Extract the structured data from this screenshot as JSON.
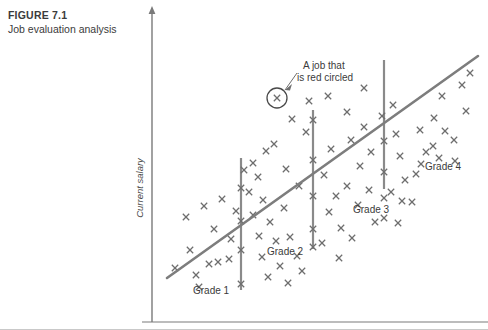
{
  "caption": {
    "figure_number": "FIGURE 7.1",
    "figure_title": "Job evaluation analysis"
  },
  "axes": {
    "y_label": "Current salary",
    "x_label": ""
  },
  "annotations": {
    "callout": "A job that\nis red circled",
    "callout_line1": "A job that",
    "callout_line2": "is red circled"
  },
  "grade_labels": [
    {
      "text": "Grade 1",
      "x": 193,
      "y": 294
    },
    {
      "text": "Grade 2",
      "x": 267,
      "y": 255
    },
    {
      "text": "Grade 3",
      "x": 353,
      "y": 213
    },
    {
      "text": "Grade 4",
      "x": 425,
      "y": 170
    }
  ],
  "colors": {
    "axis": "#7a7a7a",
    "marker": "#6e6e6e",
    "trend_line": "#7d7d7d",
    "grade_divider": "#8a8a8a",
    "text": "#3b3b3b",
    "background": "#ffffff",
    "border": "#c9c9c9"
  },
  "chart_data": {
    "type": "scatter",
    "title": "Job evaluation analysis",
    "xlabel": "",
    "ylabel": "Current salary",
    "grid": false,
    "legend": "none",
    "axis_origin": {
      "x": 152,
      "y": 322
    },
    "axis_top": {
      "x": 152,
      "y": 6
    },
    "axis_right": {
      "x": 488,
      "y": 322
    },
    "trend_line": {
      "x1": 167,
      "y1": 278,
      "x2": 478,
      "y2": 56
    },
    "grade_dividers": [
      {
        "grade": 1,
        "x": 241,
        "y1": 158,
        "y2": 290
      },
      {
        "grade": 2,
        "x": 313,
        "y1": 110,
        "y2": 249
      },
      {
        "grade": 3,
        "x": 384,
        "y1": 60,
        "y2": 189
      }
    ],
    "highlighted_point": {
      "x": 277,
      "y": 98,
      "radius": 10,
      "note": "A job that is red circled"
    },
    "points": [
      [
        186,
        217
      ],
      [
        204,
        206
      ],
      [
        214,
        229
      ],
      [
        222,
        199
      ],
      [
        190,
        250
      ],
      [
        209,
        264
      ],
      [
        229,
        259
      ],
      [
        231,
        239
      ],
      [
        175,
        268
      ],
      [
        196,
        275
      ],
      [
        218,
        262
      ],
      [
        236,
        211
      ],
      [
        241,
        221
      ],
      [
        241,
        250
      ],
      [
        241,
        284
      ],
      [
        241,
        188
      ],
      [
        253,
        163
      ],
      [
        258,
        177
      ],
      [
        266,
        151
      ],
      [
        274,
        144
      ],
      [
        263,
        200
      ],
      [
        253,
        215
      ],
      [
        270,
        222
      ],
      [
        284,
        208
      ],
      [
        259,
        236
      ],
      [
        276,
        241
      ],
      [
        290,
        237
      ],
      [
        262,
        257
      ],
      [
        280,
        266
      ],
      [
        297,
        256
      ],
      [
        268,
        277
      ],
      [
        288,
        283
      ],
      [
        302,
        271
      ],
      [
        249,
        192
      ],
      [
        286,
        169
      ],
      [
        299,
        186
      ],
      [
        306,
        132
      ],
      [
        313,
        120
      ],
      [
        313,
        160
      ],
      [
        313,
        196
      ],
      [
        313,
        229
      ],
      [
        313,
        247
      ],
      [
        324,
        175
      ],
      [
        331,
        149
      ],
      [
        336,
        196
      ],
      [
        329,
        212
      ],
      [
        341,
        228
      ],
      [
        322,
        243
      ],
      [
        339,
        258
      ],
      [
        352,
        238
      ],
      [
        358,
        205
      ],
      [
        347,
        186
      ],
      [
        360,
        166
      ],
      [
        351,
        140
      ],
      [
        364,
        127
      ],
      [
        371,
        152
      ],
      [
        369,
        190
      ],
      [
        375,
        222
      ],
      [
        382,
        116
      ],
      [
        384,
        141
      ],
      [
        384,
        172
      ],
      [
        384,
        198
      ],
      [
        384,
        218
      ],
      [
        393,
        105
      ],
      [
        396,
        134
      ],
      [
        400,
        156
      ],
      [
        405,
        180
      ],
      [
        391,
        192
      ],
      [
        402,
        201
      ],
      [
        412,
        202
      ],
      [
        398,
        223
      ],
      [
        416,
        174
      ],
      [
        426,
        152
      ],
      [
        420,
        130
      ],
      [
        434,
        118
      ],
      [
        442,
        96
      ],
      [
        445,
        131
      ],
      [
        454,
        140
      ],
      [
        466,
        111
      ],
      [
        462,
        85
      ],
      [
        470,
        73
      ],
      [
        439,
        158
      ],
      [
        199,
        287
      ],
      [
        244,
        170
      ],
      [
        292,
        119
      ],
      [
        309,
        101
      ],
      [
        328,
        96
      ],
      [
        347,
        112
      ],
      [
        364,
        88
      ],
      [
        421,
        164
      ],
      [
        433,
        146
      ],
      [
        455,
        161
      ]
    ]
  }
}
